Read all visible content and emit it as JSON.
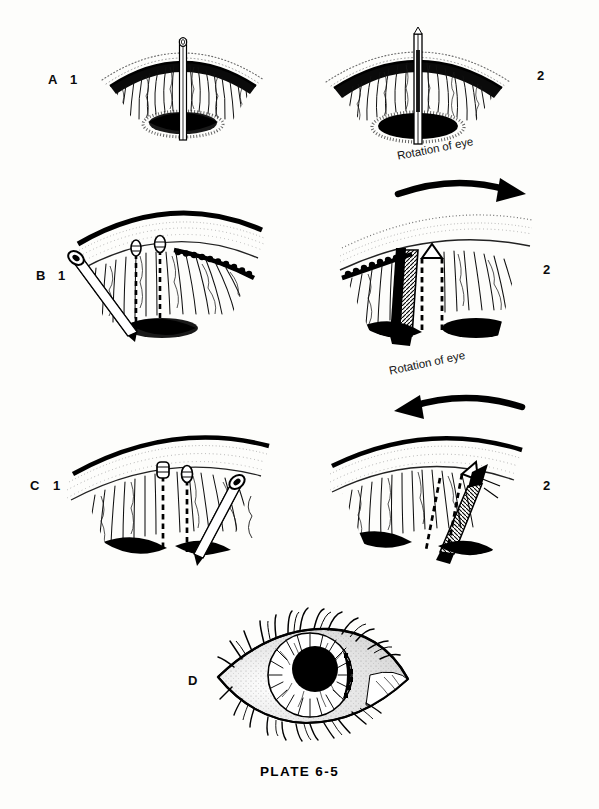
{
  "plate": {
    "caption": "PLATE  6-5",
    "background_color": "#fdfdfb",
    "ink_color": "#000000"
  },
  "rows": [
    {
      "id": "A",
      "row_label": "A",
      "sub_labels": [
        "1",
        "2"
      ],
      "rotation_annotation": null,
      "description": "Fan-shaped meridional section of ciliary body and iris root with a straight vertical needle / knife passing through the tissue; left view 1 and right view 2."
    },
    {
      "id": "B",
      "row_label": "B",
      "sub_labels": [
        "1",
        "2"
      ],
      "rotation_annotation": {
        "text": "Rotation of eye",
        "arrow_direction": "right"
      },
      "description": "Fan-shaped section with dashed needle tracks and an obliquely inserted cannula from the left; right view shows the eye after rotation with instrument shaft shaded."
    },
    {
      "id": "C",
      "row_label": "C",
      "sub_labels": [
        "1",
        "2"
      ],
      "rotation_annotation": {
        "text": "Rotation of eye",
        "arrow_direction": "left"
      },
      "description": "Mirror-image of row B: dashed needle tracks with an obliquely inserted cannula from the right; right view shows the eye after leftward rotation."
    },
    {
      "id": "D",
      "row_label": "D",
      "sub_labels": [],
      "rotation_annotation": null,
      "description": "Frontal external view of a human eye with eyelashes, sclera, stippled shading, radially striated iris and a large black pupil."
    }
  ],
  "icons": {
    "rotation_arrow_right": "curved-arrow-right-icon",
    "rotation_arrow_left": "curved-arrow-left-icon"
  }
}
